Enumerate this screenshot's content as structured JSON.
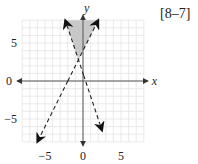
{
  "reference": "[8–7]",
  "chart_data": {
    "type": "line",
    "title": "",
    "xlabel": "x",
    "ylabel": "y",
    "xlim": [
      -8,
      8
    ],
    "ylim": [
      -8,
      8
    ],
    "grid": true,
    "x_ticks": [
      {
        "value": -5,
        "label": "−5"
      },
      {
        "value": 0,
        "label": "0"
      },
      {
        "value": 5,
        "label": "5"
      }
    ],
    "y_ticks": [
      {
        "value": 5,
        "label": "5"
      },
      {
        "value": 0,
        "label": "0"
      },
      {
        "value": -5,
        "label": "−5"
      }
    ],
    "series": [
      {
        "name": "boundary-1",
        "equation": "y = 2x + 4",
        "slope": 2,
        "intercept": 4,
        "style": "dashed",
        "x_range": [
          -6,
          2
        ]
      },
      {
        "name": "boundary-2",
        "equation": "y = -3x + 1",
        "slope": -3,
        "intercept": 1,
        "style": "dashed",
        "x_range": [
          -2.33,
          2.5
        ]
      }
    ],
    "shaded_region": {
      "description": "y > 2x + 4 and y > -3x + 1",
      "vertices": [
        [
          -0.6,
          2.8
        ],
        [
          -2.33,
          8
        ],
        [
          2,
          8
        ]
      ],
      "color": "#c8c8c8"
    }
  }
}
